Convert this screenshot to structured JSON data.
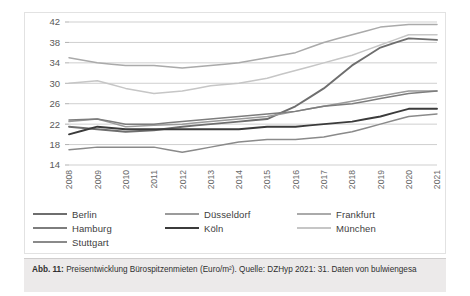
{
  "caption": {
    "prefix": "Abb. 11:",
    "text": " Preisentwicklung Bürospitzenmieten (Euro/m²). Quelle: DZHyp 2021: 31. Daten von bulwiengesa"
  },
  "legend": {
    "items": [
      {
        "label": "Berlin",
        "color": "#6e6e6e"
      },
      {
        "label": "Düsseldorf",
        "color": "#9b9b9b"
      },
      {
        "label": "Frankfurt",
        "color": "#aaaaaa"
      },
      {
        "label": "Hamburg",
        "color": "#7d7d7d"
      },
      {
        "label": "Köln",
        "color": "#3b3b3b"
      },
      {
        "label": "München",
        "color": "#c6c6c6"
      },
      {
        "label": "Stuttgart",
        "color": "#8a8a8a"
      }
    ]
  },
  "chart_data": {
    "type": "line",
    "title": "",
    "xlabel": "",
    "ylabel": "",
    "ylim": [
      14,
      42
    ],
    "yticks": [
      14,
      18,
      22,
      26,
      30,
      34,
      38,
      42
    ],
    "grid": true,
    "legend_position": "bottom",
    "x": [
      "2008",
      "2009",
      "2010",
      "2011",
      "2012",
      "2013",
      "2014",
      "2015",
      "2016",
      "2017",
      "2018",
      "2019",
      "2020",
      "2021"
    ],
    "series": [
      {
        "name": "Berlin",
        "color": "#6e6e6e",
        "values": [
          21.5,
          21.0,
          20.5,
          20.8,
          21.5,
          22.0,
          22.5,
          23.0,
          25.5,
          29.0,
          33.5,
          37.0,
          38.8,
          38.5
        ]
      },
      {
        "name": "Düsseldorf",
        "color": "#9b9b9b",
        "values": [
          22.5,
          23.0,
          21.5,
          21.8,
          22.0,
          22.5,
          23.0,
          23.5,
          24.5,
          25.5,
          26.5,
          27.5,
          28.5,
          28.5
        ]
      },
      {
        "name": "Frankfurt",
        "color": "#aaaaaa",
        "values": [
          35.0,
          34.0,
          33.5,
          33.5,
          33.0,
          33.5,
          34.0,
          35.0,
          36.0,
          38.0,
          39.5,
          41.0,
          41.5,
          41.5
        ]
      },
      {
        "name": "Hamburg",
        "color": "#7d7d7d",
        "values": [
          22.8,
          23.0,
          22.0,
          22.0,
          22.5,
          23.0,
          23.5,
          24.0,
          24.5,
          25.5,
          26.0,
          27.0,
          28.0,
          28.5
        ]
      },
      {
        "name": "Köln",
        "color": "#3b3b3b",
        "values": [
          20.0,
          21.5,
          21.0,
          21.0,
          21.0,
          21.0,
          21.0,
          21.5,
          21.5,
          22.0,
          22.5,
          23.5,
          25.0,
          25.0
        ]
      },
      {
        "name": "München",
        "color": "#c6c6c6",
        "values": [
          30.0,
          30.5,
          29.0,
          28.0,
          28.5,
          29.5,
          30.0,
          31.0,
          32.5,
          34.0,
          35.5,
          37.5,
          39.5,
          39.5
        ]
      },
      {
        "name": "Stuttgart",
        "color": "#8a8a8a",
        "values": [
          17.0,
          17.5,
          17.5,
          17.5,
          16.5,
          17.5,
          18.5,
          19.0,
          19.0,
          19.5,
          20.5,
          22.0,
          23.5,
          24.0
        ]
      }
    ]
  }
}
